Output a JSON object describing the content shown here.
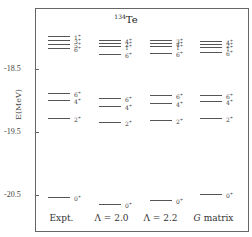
{
  "diagram": {
    "title": "Te",
    "title_mass": "134",
    "y_axis": {
      "label": "E(MeV)",
      "ticks": [
        {
          "value": -18.5,
          "label": "-18.5",
          "y": 69
        },
        {
          "value": -19.5,
          "label": "-19.5",
          "y": 132
        },
        {
          "value": -20.5,
          "label": "-20.5",
          "y": 195
        }
      ]
    },
    "columns": [
      {
        "label": "Expt.",
        "x": 48,
        "label_x": 34,
        "levels": [
          {
            "spin": "1+",
            "y": 36
          },
          {
            "spin": "3+",
            "y": 40
          },
          {
            "spin": "5+",
            "y": 44
          },
          {
            "spin": "6+",
            "y": 48
          },
          {
            "spin": "6+",
            "y": 93
          },
          {
            "spin": "4+",
            "y": 100
          },
          {
            "spin": "2+",
            "y": 118
          },
          {
            "spin": "0+",
            "y": 197
          }
        ]
      },
      {
        "label": "Λ = 2.0",
        "x": 99,
        "label_x": 84,
        "levels": [
          {
            "spin": "4+",
            "y": 40
          },
          {
            "spin": "2+",
            "y": 43
          },
          {
            "spin": "1+",
            "y": 46
          },
          {
            "spin": "6+",
            "y": 54
          },
          {
            "spin": "6+",
            "y": 98
          },
          {
            "spin": "4+",
            "y": 106
          },
          {
            "spin": "2+",
            "y": 122
          },
          {
            "spin": "0+",
            "y": 204
          }
        ]
      },
      {
        "label": "Λ = 2.2",
        "x": 150,
        "label_x": 133,
        "levels": [
          {
            "spin": "3+",
            "y": 40
          },
          {
            "spin": "4+",
            "y": 43
          },
          {
            "spin": "1+",
            "y": 46
          },
          {
            "spin": "6+",
            "y": 53
          },
          {
            "spin": "6+",
            "y": 95
          },
          {
            "spin": "4+",
            "y": 103
          },
          {
            "spin": "2+",
            "y": 120
          },
          {
            "spin": "0+",
            "y": 200
          }
        ]
      },
      {
        "label_italic": "G",
        "label_rest": " matrix",
        "x": 200,
        "label_x": 186,
        "levels": [
          {
            "spin": "4+",
            "y": 41
          },
          {
            "spin": "2+",
            "y": 44
          },
          {
            "spin": "1+",
            "y": 47
          },
          {
            "spin": "6+",
            "y": 52
          },
          {
            "spin": "6+",
            "y": 95
          },
          {
            "spin": "4+",
            "y": 101
          },
          {
            "spin": "2+",
            "y": 118
          },
          {
            "spin": "0+",
            "y": 194
          }
        ]
      }
    ]
  }
}
